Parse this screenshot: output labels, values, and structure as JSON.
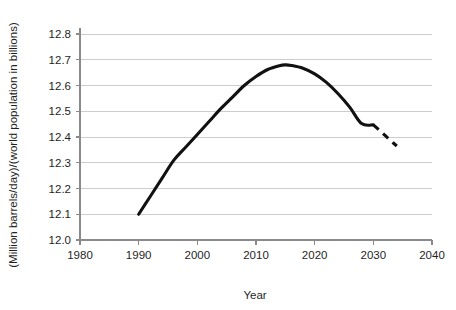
{
  "chart_data": {
    "type": "line",
    "title": "",
    "subtitle": "",
    "xlabel": "Year",
    "ylabel": "(Million barrels/day)/(world population in billions)",
    "xlim": [
      1980,
      2040
    ],
    "ylim": [
      12.0,
      12.8
    ],
    "xticks": [
      1980,
      1990,
      2000,
      2010,
      2020,
      2030,
      2040
    ],
    "xtick_labels": [
      "1980",
      "1990",
      "2000",
      "2010",
      "2020",
      "2030",
      "2040"
    ],
    "yticks": [
      12.0,
      12.1,
      12.2,
      12.3,
      12.4,
      12.5,
      12.6,
      12.7,
      12.8
    ],
    "ytick_labels": [
      "12.0",
      "12.1",
      "12.2",
      "12.3",
      "12.4",
      "12.5",
      "12.6",
      "12.7",
      "12.8"
    ],
    "grid": "horizontal",
    "legend": "none",
    "annotations": [],
    "series": [
      {
        "name": "Oil consumption per capita (historical)",
        "style": "solid",
        "color": "#111111",
        "x": [
          1990,
          1992,
          1994,
          1996,
          1998,
          2000,
          2002,
          2004,
          2006,
          2008,
          2010,
          2012,
          2014,
          2015,
          2016,
          2018,
          2020,
          2022,
          2024,
          2026,
          2028,
          2030
        ],
        "y": [
          12.1,
          12.17,
          12.24,
          12.31,
          12.36,
          12.41,
          12.46,
          12.51,
          12.555,
          12.6,
          12.635,
          12.662,
          12.677,
          12.68,
          12.678,
          12.667,
          12.645,
          12.612,
          12.568,
          12.515,
          12.452,
          12.447
        ]
      },
      {
        "name": "Oil consumption per capita (projected)",
        "style": "dashed",
        "color": "#111111",
        "x": [
          2030,
          2031,
          2032,
          2033,
          2034
        ],
        "y": [
          12.447,
          12.427,
          12.406,
          12.385,
          12.365
        ]
      }
    ],
    "key_points": {
      "start": {
        "year": 1990,
        "value": 12.1
      },
      "peak": {
        "year": 2015,
        "value": 12.68
      },
      "solid_end": {
        "year": 2030,
        "value": 12.45
      },
      "dashed_end": {
        "year": 2034,
        "value": 12.365
      }
    },
    "colors": {
      "series": "#111111",
      "gridline": "#c8c8c8",
      "axis": "#8a8a8a",
      "text": "#1f1f1f",
      "background": "#ffffff"
    }
  }
}
